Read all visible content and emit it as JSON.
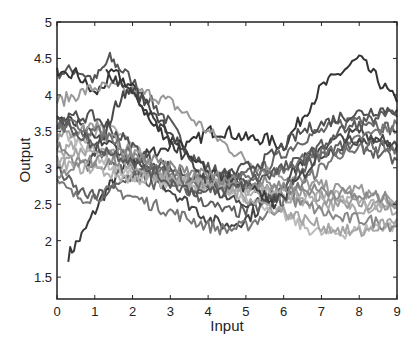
{
  "chart_data": {
    "type": "line",
    "title": "",
    "xlabel": "Input",
    "ylabel": "Output",
    "xlim": [
      0,
      9
    ],
    "ylim": [
      1.2,
      5
    ],
    "xticks": [
      0,
      1,
      2,
      3,
      4,
      5,
      6,
      7,
      8,
      9
    ],
    "yticks": [
      1.5,
      2,
      2.5,
      3,
      3.5,
      4,
      4.5,
      5
    ],
    "ytick_labels": [
      "1.5",
      "2",
      "2.5",
      "3",
      "3.5",
      "4",
      "4.5",
      "5"
    ],
    "xtick_labels": [
      "0",
      "1",
      "2",
      "3",
      "4",
      "5",
      "6",
      "7",
      "8",
      "9"
    ],
    "grid": false,
    "legend": null,
    "series": [
      {
        "name": "s1",
        "color": "#3a3a3a",
        "x": [
          0.3,
          0.7,
          1.2,
          1.6,
          2,
          2.5,
          3
        ],
        "y": [
          1.8,
          2.1,
          2.6,
          2.9,
          3.1,
          3.2,
          3.3
        ]
      },
      {
        "name": "s2",
        "color": "#555555",
        "x": [
          0,
          0.5,
          1,
          1.4,
          1.8,
          2.5,
          3,
          3.5,
          4,
          4.5,
          5,
          5.5,
          6
        ],
        "y": [
          4.3,
          4.35,
          4.2,
          4.5,
          4.3,
          3.9,
          3.6,
          3.2,
          3.0,
          2.9,
          2.8,
          2.7,
          2.5
        ]
      },
      {
        "name": "s3",
        "color": "#333333",
        "x": [
          0,
          0.5,
          1,
          1.5,
          2,
          2.5,
          3,
          3.5,
          4,
          4.5,
          5,
          5.5,
          6,
          6.5,
          7,
          7.5,
          8,
          8.5,
          9
        ],
        "y": [
          4.2,
          4.3,
          4.0,
          4.3,
          4.1,
          3.6,
          3.4,
          3.3,
          3.5,
          3.5,
          3.4,
          3.4,
          3.3,
          3.7,
          4.1,
          4.3,
          4.5,
          4.2,
          3.9
        ]
      },
      {
        "name": "s4",
        "color": "#666666",
        "x": [
          0,
          0.5,
          1,
          1.5,
          2,
          2.5,
          3,
          3.5,
          4,
          4.5,
          5,
          5.5,
          6,
          6.5,
          7,
          7.5,
          8,
          8.5,
          9
        ],
        "y": [
          3.6,
          3.5,
          3.3,
          3.0,
          2.9,
          2.8,
          2.75,
          2.7,
          2.7,
          2.8,
          2.9,
          3.0,
          3.2,
          3.4,
          3.5,
          3.6,
          3.7,
          3.6,
          3.5
        ]
      },
      {
        "name": "s5",
        "color": "#999999",
        "x": [
          0,
          0.5,
          1,
          1.5,
          2,
          2.5,
          3,
          3.5,
          4,
          4.5,
          5,
          5.5,
          6,
          6.5,
          7,
          7.5,
          8,
          8.5,
          9
        ],
        "y": [
          3.9,
          4.0,
          4.1,
          4.1,
          4.05,
          4.0,
          3.9,
          3.7,
          3.5,
          3.3,
          3.1,
          3.0,
          2.9,
          2.8,
          2.75,
          2.7,
          2.7,
          2.6,
          2.5
        ]
      },
      {
        "name": "s6",
        "color": "#aaaaaa",
        "x": [
          0,
          0.5,
          1,
          1.5,
          2,
          2.5,
          3,
          3.5,
          4,
          4.5,
          5,
          5.5,
          6,
          6.5,
          7,
          7.5,
          8,
          8.5,
          9
        ],
        "y": [
          3.2,
          3.3,
          3.5,
          3.6,
          3.3,
          3.0,
          2.85,
          2.8,
          2.8,
          2.75,
          2.7,
          2.65,
          2.6,
          2.55,
          2.5,
          2.5,
          2.45,
          2.45,
          2.4
        ]
      },
      {
        "name": "s7",
        "color": "#444444",
        "x": [
          0,
          0.5,
          1,
          1.5,
          2,
          2.5,
          3,
          3.5,
          4,
          4.5,
          5,
          5.5,
          6,
          6.5,
          7,
          7.5,
          8,
          8.5,
          9
        ],
        "y": [
          3.7,
          3.6,
          3.4,
          3.3,
          3.1,
          2.9,
          2.7,
          2.5,
          2.3,
          2.2,
          2.3,
          2.5,
          2.8,
          3.1,
          3.3,
          3.4,
          3.5,
          3.4,
          3.3
        ]
      },
      {
        "name": "s8",
        "color": "#777777",
        "x": [
          0,
          0.5,
          1,
          1.5,
          2,
          2.5,
          3,
          3.5,
          4,
          4.5,
          5,
          5.5,
          6,
          6.5,
          7,
          7.5,
          8,
          8.5,
          9
        ],
        "y": [
          2.8,
          2.6,
          2.6,
          2.7,
          2.6,
          2.5,
          2.4,
          2.3,
          2.2,
          2.15,
          2.2,
          2.35,
          2.5,
          2.8,
          3.0,
          3.2,
          3.4,
          3.5,
          3.6
        ]
      },
      {
        "name": "s9",
        "color": "#bbbbbb",
        "x": [
          0,
          0.5,
          1,
          1.5,
          2,
          2.5,
          3,
          3.5,
          4,
          4.5,
          5,
          5.5,
          6,
          6.5,
          7,
          7.5,
          8,
          8.5,
          9
        ],
        "y": [
          3.5,
          3.4,
          3.2,
          3.0,
          2.9,
          2.85,
          2.8,
          2.8,
          2.75,
          2.7,
          2.6,
          2.5,
          2.35,
          2.2,
          2.1,
          2.1,
          2.15,
          2.2,
          2.2
        ]
      },
      {
        "name": "s10",
        "color": "#888888",
        "x": [
          0,
          0.5,
          1,
          1.5,
          2,
          2.5,
          3,
          3.5,
          4,
          4.5,
          5,
          5.5,
          6,
          6.5,
          7,
          7.5,
          8,
          8.5,
          9
        ],
        "y": [
          3.3,
          3.1,
          3.0,
          3.1,
          3.0,
          2.9,
          2.85,
          2.8,
          2.8,
          2.8,
          2.75,
          2.7,
          2.6,
          2.5,
          2.4,
          2.3,
          2.3,
          2.25,
          2.2
        ]
      },
      {
        "name": "s11",
        "color": "#505050",
        "x": [
          0,
          0.5,
          1,
          1.5,
          2,
          2.5,
          3,
          3.5,
          4,
          4.5,
          5,
          5.5,
          6,
          6.5,
          7,
          7.5,
          8,
          8.5,
          9
        ],
        "y": [
          3.6,
          3.7,
          3.7,
          3.5,
          3.3,
          3.1,
          3.0,
          2.9,
          2.85,
          2.9,
          3.0,
          3.1,
          3.3,
          3.5,
          3.6,
          3.7,
          3.75,
          3.8,
          3.8
        ]
      },
      {
        "name": "s12",
        "color": "#9a9a9a",
        "x": [
          0,
          0.5,
          1,
          1.5,
          2,
          2.5,
          3,
          3.5,
          4,
          4.5,
          5,
          5.5,
          6,
          6.5,
          7,
          7.5,
          8,
          8.5,
          9
        ],
        "y": [
          3.4,
          3.5,
          3.6,
          3.4,
          3.2,
          3.0,
          2.9,
          2.85,
          2.8,
          2.8,
          2.75,
          2.7,
          2.7,
          2.65,
          2.6,
          2.55,
          2.5,
          2.5,
          2.45
        ]
      },
      {
        "name": "s13",
        "color": "#606060",
        "x": [
          0,
          0.5,
          1,
          1.5,
          2,
          2.5,
          3,
          3.5,
          4,
          4.5,
          5,
          5.5,
          6,
          6.5,
          7,
          7.5,
          8,
          8.5,
          9
        ],
        "y": [
          3.0,
          2.7,
          2.6,
          2.7,
          2.9,
          3.0,
          2.9,
          2.7,
          2.5,
          2.4,
          2.4,
          2.5,
          2.7,
          3.0,
          3.2,
          3.3,
          3.3,
          3.2,
          3.1
        ]
      },
      {
        "name": "s14",
        "color": "#b0b0b0",
        "x": [
          0,
          0.5,
          1,
          1.5,
          2,
          2.5,
          3,
          3.5,
          4,
          4.5,
          5,
          5.5,
          6,
          6.5,
          7,
          7.5,
          8,
          8.5,
          9
        ],
        "y": [
          3.1,
          3.0,
          3.0,
          2.9,
          2.85,
          2.85,
          2.8,
          2.8,
          2.75,
          2.7,
          2.7,
          2.7,
          2.65,
          2.6,
          2.6,
          2.6,
          2.55,
          2.5,
          2.5
        ]
      },
      {
        "name": "s15",
        "color": "#484848",
        "x": [
          0.8,
          1.2,
          1.6,
          2,
          2.5,
          3,
          3.5,
          4,
          4.5,
          5,
          5.5,
          6,
          6.5,
          7,
          7.5,
          8,
          8.5,
          9
        ],
        "y": [
          3.0,
          3.4,
          3.9,
          4.1,
          3.8,
          3.5,
          3.1,
          2.8,
          2.6,
          2.5,
          2.5,
          2.6,
          2.9,
          3.2,
          3.3,
          3.4,
          3.4,
          3.3
        ]
      },
      {
        "name": "s16",
        "color": "#707070",
        "x": [
          0,
          0.5,
          1,
          1.5,
          2,
          2.5,
          3,
          3.5,
          4,
          4.5,
          5,
          5.5,
          6,
          6.5,
          7,
          7.5,
          8,
          8.5,
          9
        ],
        "y": [
          3.55,
          3.6,
          3.5,
          3.4,
          3.2,
          3.0,
          2.9,
          2.8,
          2.75,
          2.8,
          2.85,
          2.9,
          3.0,
          3.1,
          3.2,
          3.25,
          3.3,
          3.3,
          3.25
        ]
      },
      {
        "name": "s17",
        "color": "#a5a5a5",
        "x": [
          0,
          0.5,
          1,
          1.5,
          2,
          2.5,
          3,
          3.5,
          4,
          4.5,
          5,
          5.5,
          6,
          6.5,
          7,
          7.5,
          8,
          8.5,
          9
        ],
        "y": [
          3.0,
          3.2,
          3.3,
          3.2,
          3.0,
          2.9,
          2.85,
          2.8,
          2.8,
          2.7,
          2.6,
          2.5,
          2.4,
          2.3,
          2.2,
          2.15,
          2.1,
          2.2,
          2.3
        ]
      },
      {
        "name": "s18",
        "color": "#3c3c3c",
        "x": [
          1.3,
          1.8,
          2.3,
          2.8,
          3.3,
          3.8,
          4.3,
          4.8,
          5.3,
          5.8
        ],
        "y": [
          4.3,
          4.1,
          3.8,
          3.5,
          3.2,
          3.0,
          2.9,
          2.8,
          2.65,
          2.5
        ]
      },
      {
        "name": "s19",
        "color": "#8a8a8a",
        "x": [
          0,
          0.5,
          1,
          1.5,
          2,
          2.5,
          3,
          3.5,
          4,
          4.5,
          5,
          5.5,
          6,
          6.5,
          7,
          7.5,
          8,
          8.5,
          9
        ],
        "y": [
          2.9,
          3.0,
          3.1,
          3.2,
          3.15,
          3.1,
          3.0,
          2.95,
          2.9,
          2.85,
          2.8,
          2.8,
          2.75,
          2.7,
          2.7,
          2.65,
          2.6,
          2.6,
          2.55
        ]
      },
      {
        "name": "s20",
        "color": "#5a5a5a",
        "x": [
          0,
          0.5,
          1,
          1.5,
          2,
          2.5,
          3,
          3.5,
          4,
          4.5,
          5,
          5.5,
          6,
          6.5,
          7,
          7.5,
          8,
          8.5,
          9
        ],
        "y": [
          3.7,
          3.5,
          3.3,
          3.2,
          3.1,
          2.95,
          2.8,
          2.7,
          2.65,
          2.7,
          2.8,
          2.9,
          3.0,
          3.1,
          3.3,
          3.5,
          3.6,
          3.7,
          3.7
        ]
      }
    ]
  },
  "plot_box": {
    "left": 57,
    "top": 22,
    "right": 397,
    "bottom": 299
  }
}
